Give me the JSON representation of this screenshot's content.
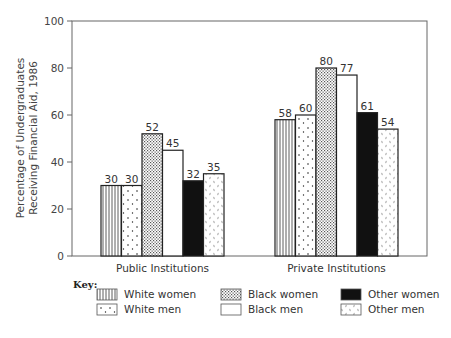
{
  "chart_data": {
    "type": "bar",
    "title": "",
    "xlabel": "",
    "ylabel": "Percentage of Undergraduates Receiving Financial Aid, 1986",
    "ylabel_lines": [
      "Percentage of Undergraduates",
      "Receiving Financial Aid, 1986"
    ],
    "ylim": [
      0,
      100
    ],
    "yticks": [
      0,
      20,
      40,
      60,
      80,
      100
    ],
    "grid": false,
    "legend_position": "bottom",
    "legend_title": "Key:",
    "categories": [
      "Public Institutions",
      "Private Institutions"
    ],
    "series": [
      {
        "name": "White women",
        "pattern": "vertical-lines",
        "values": [
          30,
          58
        ]
      },
      {
        "name": "White men",
        "pattern": "dots",
        "values": [
          30,
          60
        ]
      },
      {
        "name": "Black women",
        "pattern": "crosshatch",
        "values": [
          52,
          80
        ]
      },
      {
        "name": "Black men",
        "pattern": "blank",
        "values": [
          45,
          77
        ]
      },
      {
        "name": "Other women",
        "pattern": "solid-black",
        "values": [
          32,
          61
        ]
      },
      {
        "name": "Other men",
        "pattern": "speckles",
        "values": [
          35,
          54
        ]
      }
    ]
  }
}
